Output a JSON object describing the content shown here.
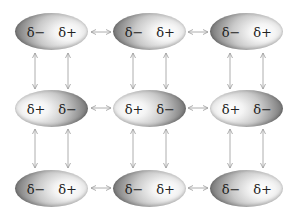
{
  "diagram": {
    "title": "",
    "colors": {
      "arrow": "#9a9a9a",
      "charge_text": "#222222",
      "molecule_dark": "#7a7a7a",
      "molecule_light": "#ffffff"
    },
    "rows": [
      {
        "molecules": [
          {
            "left_label": "δ−",
            "right_label": "δ+"
          },
          {
            "left_label": "δ−",
            "right_label": "δ+"
          },
          {
            "left_label": "δ−",
            "right_label": "δ+"
          }
        ]
      },
      {
        "molecules": [
          {
            "left_label": "δ+",
            "right_label": "δ−"
          },
          {
            "left_label": "δ+",
            "right_label": "δ−"
          },
          {
            "left_label": "δ+",
            "right_label": "δ−"
          }
        ]
      },
      {
        "molecules": [
          {
            "left_label": "δ−",
            "right_label": "δ+"
          },
          {
            "left_label": "δ−",
            "right_label": "δ+"
          },
          {
            "left_label": "δ−",
            "right_label": "δ+"
          }
        ]
      }
    ],
    "interactions": {
      "horizontal": "double-headed arrows between adjacent molecules in each row",
      "vertical": "double-headed arrows between charge centers of vertically adjacent molecules"
    }
  }
}
